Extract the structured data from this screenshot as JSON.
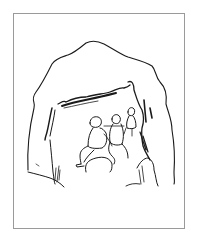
{
  "illustration": {
    "subject": "line drawing of three people seated inside a cave mouth",
    "style": "black ink line art on white",
    "frame_color": "#9a9a9a",
    "ink_color": "#1a1a1a",
    "background_color": "#ffffff",
    "figures_count": 3
  }
}
